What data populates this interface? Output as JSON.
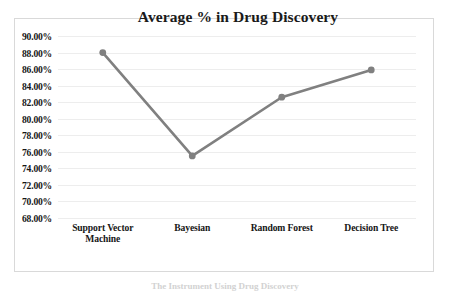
{
  "chart_data": {
    "type": "line",
    "title": "Average % in Drug Discovery",
    "xlabel": "",
    "ylabel": "",
    "categories": [
      "Support Vector Machine",
      "Bayesian",
      "Random Forest",
      "Decision Tree"
    ],
    "category_lines": [
      [
        "Support Vector",
        "Machine"
      ],
      [
        "Bayesian"
      ],
      [
        "Random Forest"
      ],
      [
        "Decision Tree"
      ]
    ],
    "values": [
      88.0,
      75.5,
      82.6,
      85.9
    ],
    "value_labels": [
      "88.00%",
      "75.50%",
      "82.60%",
      "85.90%"
    ],
    "ylim": [
      68,
      90
    ],
    "ytick_step": 2,
    "ytick_labels": [
      "90.00%",
      "88.00%",
      "86.00%",
      "84.00%",
      "82.00%",
      "80.00%",
      "78.00%",
      "76.00%",
      "74.00%",
      "72.00%",
      "70.00%",
      "68.00%"
    ],
    "ytick_values": [
      90,
      88,
      86,
      84,
      82,
      80,
      78,
      76,
      74,
      72,
      70,
      68
    ],
    "grid": true,
    "legend": false,
    "legend_position": "none",
    "series_color": "#808080",
    "marker_color": "#808080",
    "gridline_color": "#ededed",
    "frame_color": "#d9d9d9",
    "text_color": "#161616"
  },
  "caption": {
    "text": "The Instrument Using Drug Discovery"
  }
}
